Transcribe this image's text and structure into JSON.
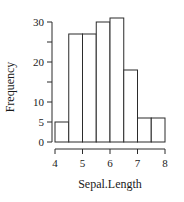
{
  "chart_data": {
    "type": "bar",
    "subtype": "histogram",
    "title": "",
    "xlabel": "Sepal.Length",
    "ylabel": "Frequency",
    "bin_edges": [
      4,
      4.5,
      5,
      5.5,
      6,
      6.5,
      7,
      7.5,
      8
    ],
    "categories": [
      "4-4.5",
      "4.5-5",
      "5-5.5",
      "5.5-6",
      "6-6.5",
      "6.5-7",
      "7-7.5",
      "7.5-8"
    ],
    "values": [
      5,
      27,
      27,
      30,
      31,
      18,
      6,
      6
    ],
    "xlim": [
      4,
      8
    ],
    "ylim": [
      0,
      30
    ],
    "x_ticks": [
      4,
      5,
      6,
      7,
      8
    ],
    "y_ticks": [
      0,
      5,
      10,
      15,
      20,
      25,
      30
    ],
    "y_tick_labels": [
      "0",
      "5",
      "10",
      "",
      "20",
      "",
      "30"
    ],
    "grid": false,
    "legend": null,
    "bar_fill": "#ffffff",
    "bar_stroke": "#2b2b2b"
  }
}
